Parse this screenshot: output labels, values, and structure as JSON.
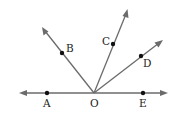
{
  "diagram": {
    "type": "rays-from-point",
    "colors": {
      "line": "#6b6b6b",
      "point": "#111111",
      "label": "#222222",
      "background": "#ffffff"
    },
    "vertex": {
      "label": "O",
      "x": 94,
      "y": 93
    },
    "line": {
      "from": [
        20,
        93
      ],
      "to": [
        168,
        93
      ],
      "arrows": "both"
    },
    "rays": [
      {
        "name": "OB",
        "tip": [
          43,
          28
        ]
      },
      {
        "name": "OC",
        "tip": [
          127,
          10
        ]
      },
      {
        "name": "OD",
        "tip": [
          163,
          40
        ]
      }
    ],
    "points": [
      {
        "label": "A",
        "x": 47,
        "y": 93,
        "label_x": 43,
        "label_y": 107
      },
      {
        "label": "B",
        "x": 62,
        "y": 53,
        "label_x": 66,
        "label_y": 52
      },
      {
        "label": "C",
        "x": 113,
        "y": 44,
        "label_x": 102,
        "label_y": 45
      },
      {
        "label": "D",
        "x": 141,
        "y": 56,
        "label_x": 143,
        "label_y": 67
      },
      {
        "label": "E",
        "x": 143,
        "y": 93,
        "label_x": 139,
        "label_y": 107
      }
    ],
    "vertex_label": {
      "text": "O",
      "x": 90,
      "y": 107
    }
  }
}
